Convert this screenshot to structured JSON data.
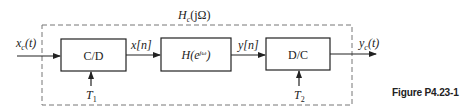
{
  "diagram": {
    "system_label": "H_c(jΩ)",
    "system_label_parts": {
      "base": "H",
      "sub": "c",
      "arg": "(jΩ)"
    },
    "blocks": [
      {
        "id": "cd",
        "label": "C/D"
      },
      {
        "id": "h",
        "label_base": "H(e",
        "label_sup": "jω",
        "label_close": ")"
      },
      {
        "id": "dc",
        "label": "D/C"
      }
    ],
    "signals": {
      "input": {
        "base": "x",
        "sub": "c",
        "arg": "(t)"
      },
      "x_n": "x[n]",
      "y_n": "y[n]",
      "output": {
        "base": "y",
        "sub": "c",
        "arg": "(t)"
      }
    },
    "sampling_periods": {
      "t1": {
        "base": "T",
        "sub": "1"
      },
      "t2": {
        "base": "T",
        "sub": "2"
      }
    },
    "colors": {
      "line": "#222222",
      "dashed_border": "#777777",
      "background": "#ffffff"
    }
  },
  "caption": "Figure P4.23-1"
}
